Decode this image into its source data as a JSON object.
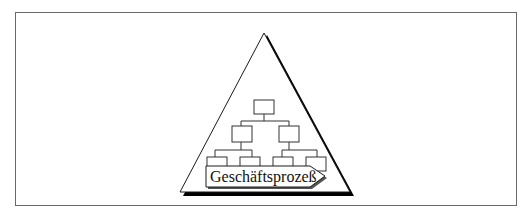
{
  "diagram": {
    "type": "pyramid-with-org-chart",
    "label": "Geschäftsprozeß",
    "colors": {
      "stroke": "#1a1a1a",
      "shadow": "#000000",
      "frame": "#6a6a6a",
      "background": "#ffffff"
    },
    "org_chart": {
      "levels": [
        {
          "level": 1,
          "boxes": 1
        },
        {
          "level": 2,
          "boxes": 2
        },
        {
          "level": 3,
          "boxes": 4
        }
      ]
    }
  }
}
